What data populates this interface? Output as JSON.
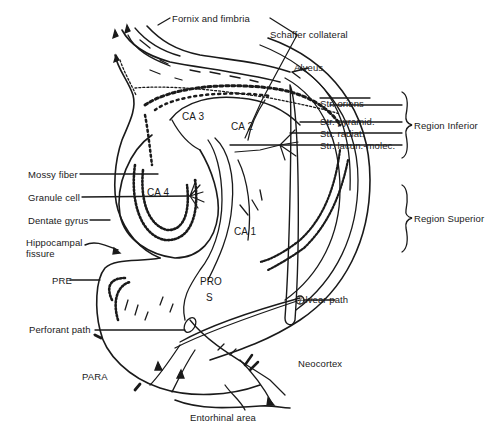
{
  "figure": {
    "line_color": "#1a1a1a",
    "background": "#ffffff"
  },
  "labels": {
    "fornix": "Fornix and fimbria",
    "schaffer": "Schaffer collateral",
    "alveus": "Alveus",
    "str_oriens": "Str. oriens",
    "str_pyramid": "Str. pyramid.",
    "str_radiat": "Str. radiat.",
    "str_lacun": "Str. lacun.-molec.",
    "region_inferior": "Region Inferior",
    "region_superior": "Region Superior",
    "mossy_fiber": "Mossy fiber",
    "granule_cell": "Granule cell",
    "dentate_gyrus": "Dentate gyrus",
    "hippocampal_fissure_1": "Hippocampal",
    "hippocampal_fissure_2": "fissure",
    "pre": "PRE",
    "perforant_path": "Perforant path",
    "para": "PARA",
    "entorhinal": "Entorhinal area",
    "neocortex": "Neocortex",
    "alvear_path": "Alvear path",
    "pro": "PRO",
    "s": "S",
    "ca1": "CA 1",
    "ca2": "CA 2",
    "ca3": "CA 3",
    "ca4": "CA 4"
  }
}
